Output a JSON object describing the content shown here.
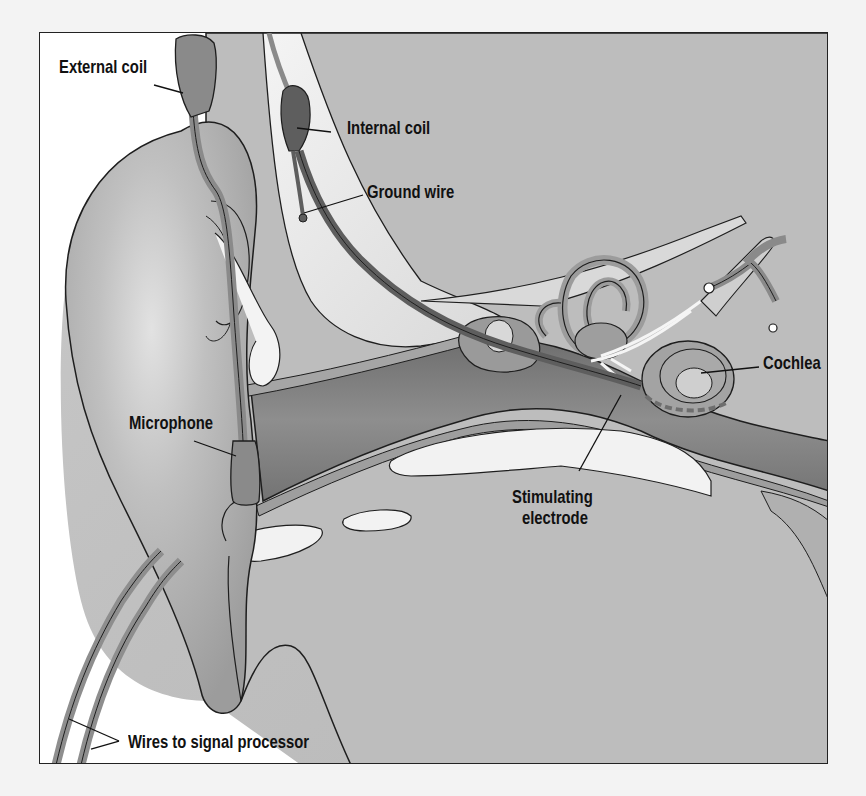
{
  "figure": {
    "labels": {
      "external_coil": "External coil",
      "internal_coil": "Internal coil",
      "ground_wire": "Ground wire",
      "cochlea": "Cochlea",
      "microphone": "Microphone",
      "stimulating_electrode_line1": "Stimulating",
      "stimulating_electrode_line2": "electrode",
      "wires": "Wires to signal processor"
    },
    "colors": {
      "page_background": "#f3f3f3",
      "frame_border": "#222222",
      "tissue_light": "#c4c4c4",
      "tissue_mid": "#a9a9a9",
      "canal_dark": "#7e7e7e",
      "device_grey": "#8a8a8a",
      "device_dark": "#5e5e5e",
      "bone_white": "#f0f0f0",
      "outline": "#1e1e1e"
    }
  }
}
